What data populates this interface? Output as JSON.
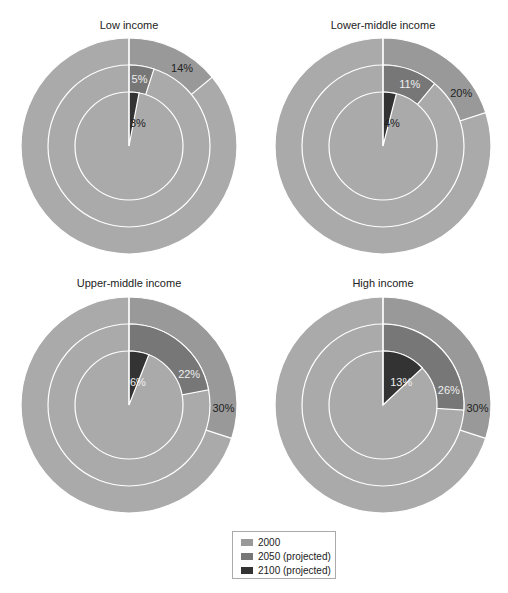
{
  "chart_data": {
    "type": "pie",
    "subtype": "nested-ring",
    "ring_order_outer_to_inner": [
      "2000",
      "2050 (projected)",
      "2100 (projected)"
    ],
    "colors": {
      "background_slice": "#aaaaaa",
      "2000": "#999999",
      "2050 (projected)": "#777777",
      "2100 (projected)": "#333333",
      "ring_separator": "#ffffff"
    },
    "panels": [
      {
        "title": "Low income",
        "values": {
          "2000": 14,
          "2050 (projected)": 5,
          "2100 (projected)": 3
        },
        "labels": [
          "14%",
          "5%",
          "3%"
        ]
      },
      {
        "title": "Lower-middle income",
        "values": {
          "2000": 20,
          "2050 (projected)": 11,
          "2100 (projected)": 4
        },
        "labels": [
          "20%",
          "11%",
          "4%"
        ]
      },
      {
        "title": "Upper-middle income",
        "values": {
          "2000": 30,
          "2050 (projected)": 22,
          "2100 (projected)": 6
        },
        "labels": [
          "30%",
          "22%",
          "6%"
        ]
      },
      {
        "title": "High income",
        "values": {
          "2000": 30,
          "2050 (projected)": 26,
          "2100 (projected)": 13
        },
        "labels": [
          "30%",
          "26%",
          "13%"
        ]
      }
    ],
    "legend": {
      "position": "bottom-center",
      "entries": [
        {
          "label": "2000",
          "color": "#999999"
        },
        {
          "label": "2050 (projected)",
          "color": "#777777"
        },
        {
          "label": "2100 (projected)",
          "color": "#333333"
        }
      ]
    }
  }
}
